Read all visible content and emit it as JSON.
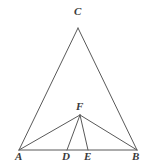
{
  "figure": {
    "background_color": "#ffffff",
    "stroke_color": "#595959",
    "label_color": "#3a3a3a",
    "stroke_width": 1,
    "canvas": {
      "width": 155,
      "height": 162
    },
    "points": [
      {
        "id": "A",
        "label": "A",
        "x": 19,
        "y": 150,
        "label_x": 15,
        "label_y": 151
      },
      {
        "id": "B",
        "label": "B",
        "x": 137,
        "y": 150,
        "label_x": 132,
        "label_y": 151
      },
      {
        "id": "C",
        "label": "C",
        "x": 78,
        "y": 28,
        "label_x": 74,
        "label_y": 6
      },
      {
        "id": "D",
        "label": "D",
        "x": 67,
        "y": 150,
        "label_x": 62,
        "label_y": 151
      },
      {
        "id": "E",
        "label": "E",
        "x": 88,
        "y": 150,
        "label_x": 84,
        "label_y": 151
      },
      {
        "id": "F",
        "label": "F",
        "x": 80,
        "y": 115,
        "label_x": 76,
        "label_y": 101
      }
    ],
    "segments": [
      {
        "id": "AC",
        "from": "A",
        "to": "C"
      },
      {
        "id": "CB",
        "from": "C",
        "to": "B"
      },
      {
        "id": "AB",
        "from": "A",
        "to": "B"
      },
      {
        "id": "AF",
        "from": "A",
        "to": "F"
      },
      {
        "id": "FB",
        "from": "F",
        "to": "B"
      },
      {
        "id": "FD",
        "from": "F",
        "to": "D"
      },
      {
        "id": "FE",
        "from": "F",
        "to": "E"
      }
    ]
  }
}
